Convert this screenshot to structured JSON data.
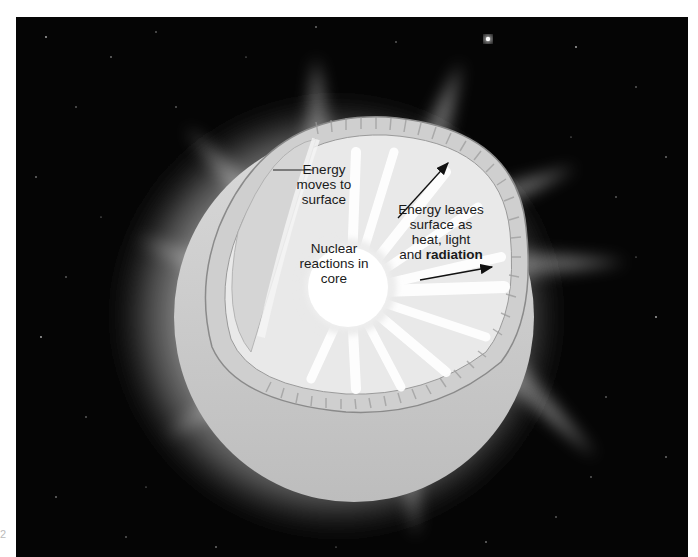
{
  "diagram": {
    "labels": {
      "moves_to_surface": [
        "Energy",
        "moves to",
        "surface"
      ],
      "nuclear_core": [
        "Nuclear",
        "reactions in",
        "core"
      ],
      "leaves_surface_line1": "Energy leaves",
      "leaves_surface_line2": "surface as",
      "leaves_surface_line3": "heat, light",
      "leaves_surface_and": "and ",
      "leaves_surface_bold": "radiation"
    },
    "page_marker": "2"
  },
  "colors": {
    "space": "#050505",
    "glow": "#e8e8e8",
    "core": "#ffffff",
    "text": "#1a1a1a",
    "arrow": "#111111"
  }
}
